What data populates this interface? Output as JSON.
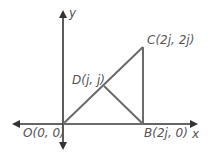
{
  "diagram": {
    "axes": {
      "x_label": "x",
      "y_label": "y"
    },
    "points": [
      {
        "id": "O",
        "label": "O(0, 0)"
      },
      {
        "id": "B",
        "label": "B(2j, 0)"
      },
      {
        "id": "C",
        "label": "C(2j, 2j)"
      },
      {
        "id": "D",
        "label": "D(j, j)"
      }
    ],
    "segments": [
      "OC",
      "CB",
      "OB",
      "DB"
    ],
    "colors": {
      "axis": "#333333",
      "segment": "#6b6b6b",
      "label": "#555555"
    }
  }
}
